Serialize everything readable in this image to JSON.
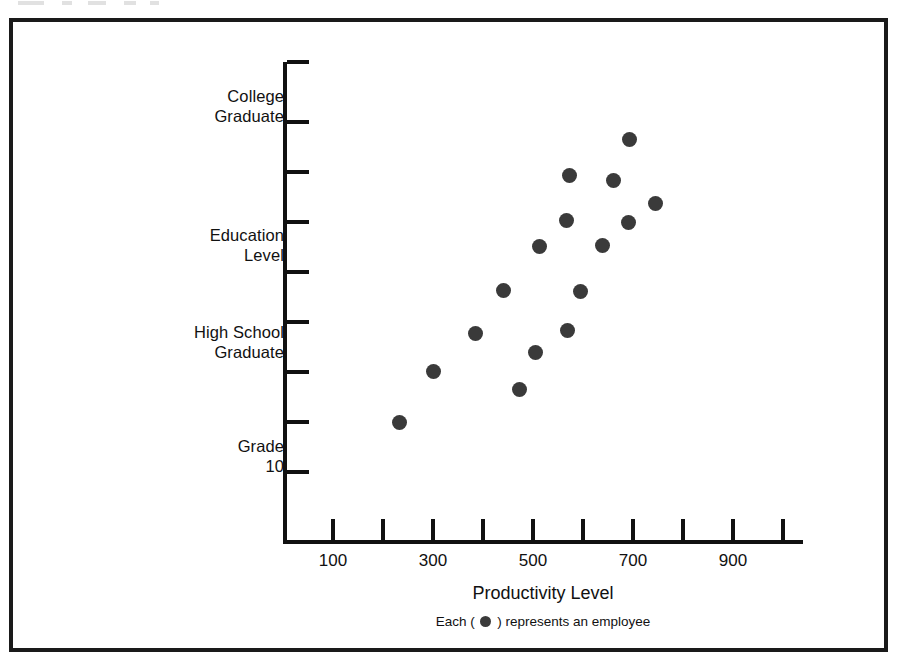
{
  "figure": {
    "caption_prefix": "Each (",
    "caption_suffix": ") represents an employee",
    "legend_marker": "filled-circle",
    "marker_color": "#3a3a3a",
    "frame_color": "#1a1a1a",
    "background": "#ffffff"
  },
  "chart_data": {
    "type": "scatter",
    "title": "",
    "subtitle": "",
    "xlabel": "Productivity Level",
    "ylabel": "Education Level",
    "xlim": [
      0,
      1000
    ],
    "ylim": [
      0,
      9
    ],
    "grid": false,
    "legend": "Each ( ● ) represents an employee",
    "legend_position": "below-axis",
    "x_ticks": [
      100,
      200,
      300,
      400,
      500,
      600,
      700,
      800,
      900,
      1000
    ],
    "x_tick_labels": [
      "100",
      "",
      "300",
      "",
      "500",
      "",
      "700",
      "",
      "900",
      ""
    ],
    "y_ticks": [
      1,
      2,
      3,
      4,
      5,
      6,
      7,
      8,
      9
    ],
    "y_tick_labels": [
      "Grade\n10",
      "",
      "",
      "High School\nGraduate",
      "",
      "",
      "",
      "College\nGraduate",
      ""
    ],
    "y_axis_title_label": "Education\nLevel",
    "y_category_labels": [
      {
        "text": "College\nGraduate",
        "tick_index": 8
      },
      {
        "text": "Education\nLevel",
        "tick_index": 5,
        "is_axis_title": true
      },
      {
        "text": "High School\nGraduate",
        "tick_index": 4
      },
      {
        "text": "Grade\n10",
        "tick_index": 1
      }
    ],
    "points": [
      {
        "x": 223,
        "y": 2.36
      },
      {
        "x": 290,
        "y": 3.38
      },
      {
        "x": 374,
        "y": 4.14
      },
      {
        "x": 462,
        "y": 3.02
      },
      {
        "x": 494,
        "y": 3.76
      },
      {
        "x": 430,
        "y": 5.0
      },
      {
        "x": 558,
        "y": 4.2
      },
      {
        "x": 584,
        "y": 4.98
      },
      {
        "x": 502,
        "y": 5.88
      },
      {
        "x": 628,
        "y": 5.9
      },
      {
        "x": 556,
        "y": 6.4
      },
      {
        "x": 680,
        "y": 6.36
      },
      {
        "x": 562,
        "y": 7.3
      },
      {
        "x": 650,
        "y": 7.2
      },
      {
        "x": 734,
        "y": 6.74
      },
      {
        "x": 692,
        "y": 8.02
      }
    ],
    "point_count": 16,
    "point_label": "employee"
  },
  "pixels": {
    "x_ticks_px": [
      333,
      383,
      433,
      483,
      533,
      583,
      633,
      683,
      733,
      783
    ],
    "x_tick_text": [
      {
        "label": "100",
        "px": 333
      },
      {
        "label": "300",
        "px": 433
      },
      {
        "label": "500",
        "px": 533
      },
      {
        "label": "700",
        "px": 633
      },
      {
        "label": "900",
        "px": 733
      }
    ],
    "y_ticks_px": [
      472,
      422,
      372,
      322,
      272,
      222,
      172,
      122,
      62
    ],
    "y_labels_px": [
      {
        "text": "College\nGraduate",
        "top": 86
      },
      {
        "text": "Education\nLevel",
        "top": 225
      },
      {
        "text": "High School\nGraduate",
        "top": 322
      },
      {
        "text": "Grade\n10",
        "top": 436
      }
    ],
    "points_px": [
      {
        "cx": 399,
        "cy": 422
      },
      {
        "cx": 433,
        "cy": 371
      },
      {
        "cx": 475,
        "cy": 333
      },
      {
        "cx": 519,
        "cy": 389
      },
      {
        "cx": 535,
        "cy": 352
      },
      {
        "cx": 503,
        "cy": 290
      },
      {
        "cx": 567,
        "cy": 330
      },
      {
        "cx": 580,
        "cy": 291
      },
      {
        "cx": 539,
        "cy": 246
      },
      {
        "cx": 602,
        "cy": 245
      },
      {
        "cx": 566,
        "cy": 220
      },
      {
        "cx": 628,
        "cy": 222
      },
      {
        "cx": 569,
        "cy": 175
      },
      {
        "cx": 613,
        "cy": 180
      },
      {
        "cx": 655,
        "cy": 203
      },
      {
        "cx": 629,
        "cy": 139
      }
    ]
  }
}
